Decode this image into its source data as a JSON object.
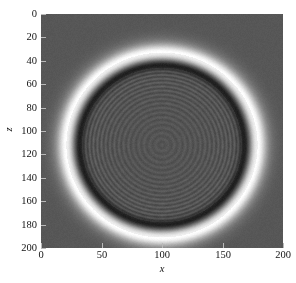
{
  "figure": {
    "kind": "grayscale-2d-field-image",
    "background_color": "#ffffff",
    "plot_background_color": "#565656"
  },
  "chart_data": {
    "type": "heatmap",
    "title": "",
    "xlabel": "x",
    "ylabel": "z",
    "xlim": [
      0,
      200
    ],
    "ylim": [
      200,
      0
    ],
    "y_axis_inverted": true,
    "grid": false,
    "legend": "none",
    "colormap": "gray",
    "xticks": [
      0,
      50,
      100,
      150,
      200
    ],
    "xticklabels": [
      "0",
      "50",
      "100",
      "150",
      "200"
    ],
    "yticks": [
      0,
      20,
      40,
      60,
      80,
      100,
      120,
      140,
      160,
      180,
      200
    ],
    "yticklabels": [
      "0",
      "20",
      "40",
      "60",
      "80",
      "100",
      "120",
      "140",
      "160",
      "180",
      "200"
    ],
    "field": {
      "background_level": 0.34,
      "halo_peak_level": 0.94,
      "rim_level": 0.04,
      "interior_mean_level": 0.33,
      "center_x": 100,
      "center_z": 112,
      "radius": 76,
      "rim_radius": 70,
      "rim_half_width": 5.5,
      "halo_radius": 79,
      "halo_half_width": 7.0,
      "interior_fringe_count": 17,
      "interior_fringe_amplitude": 0.055,
      "speckle_amplitude": 0.022
    }
  },
  "axes": {
    "x_title": "x",
    "y_title": "z"
  }
}
